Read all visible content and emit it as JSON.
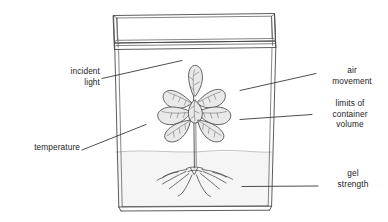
{
  "figure": {
    "width": 388,
    "height": 222,
    "background_color": "#ffffff",
    "line_color": "#3a3a3a",
    "leaf_fill_color": "#e8e8e8",
    "gel_fill_color": "#f4f4f4"
  },
  "labels": {
    "incident_light": "incident\nlight",
    "temperature": "temperature",
    "air_movement": "air\nmovement",
    "limits_of_container_volume": "limits of\ncontainer\nvolume",
    "gel_strength": "gel\nstrength"
  },
  "parts": {
    "lid": "container-lid",
    "wall_left": "container-wall-left",
    "wall_right": "container-wall-right",
    "base": "container-base",
    "gel": "gel-medium",
    "plant": "plantlet",
    "leaves": "leaf-cluster",
    "stem": "plant-stem",
    "roots": "root-system"
  },
  "leaders": [
    {
      "name": "leader-incident-light",
      "from_label": "incident_light"
    },
    {
      "name": "leader-temperature",
      "from_label": "temperature"
    },
    {
      "name": "leader-air-movement",
      "from_label": "air_movement"
    },
    {
      "name": "leader-limits",
      "from_label": "limits_of_container_volume"
    },
    {
      "name": "leader-gel-strength",
      "from_label": "gel_strength"
    }
  ]
}
